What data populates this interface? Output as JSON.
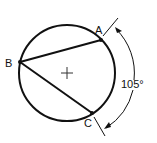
{
  "diagram": {
    "type": "inscribed-angle",
    "points": {
      "A": {
        "label": "A"
      },
      "B": {
        "label": "B"
      },
      "C": {
        "label": "C"
      }
    },
    "arc_measure": "105°",
    "center_mark": "+",
    "colors": {
      "stroke": "#111111",
      "background": "#ffffff"
    }
  }
}
